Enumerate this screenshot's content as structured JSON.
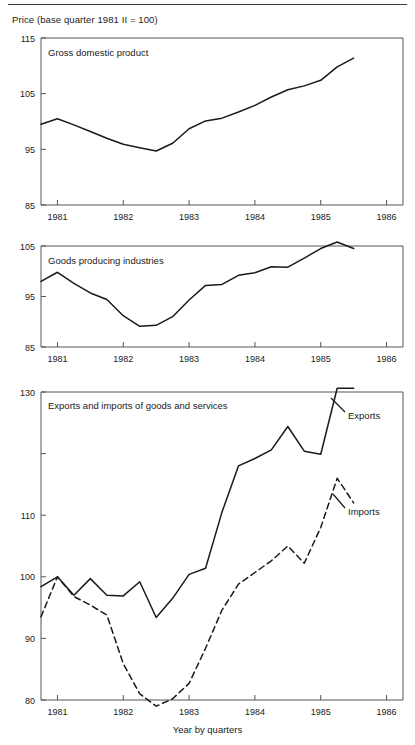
{
  "figure": {
    "super_title": "Price (base quarter 1981 II = 100)",
    "x_axis_title": "Year by quarters",
    "line_color": "#1a1a1a",
    "axis_color": "#555555",
    "background": "#ffffff"
  },
  "chart_data": [
    {
      "type": "line",
      "title": "Gross domestic product",
      "xlabel": "",
      "ylabel": "",
      "ylim": [
        85,
        115
      ],
      "yticks": [
        85,
        95,
        105,
        115
      ],
      "ytick_labels": [
        "85",
        "95",
        "105",
        "115"
      ],
      "xlim": [
        1980.75,
        1986.25
      ],
      "xticks": [
        1981,
        1982,
        1983,
        1984,
        1985,
        1986
      ],
      "xtick_labels": [
        "1981",
        "1982",
        "1983",
        "1984",
        "1985",
        "1986"
      ],
      "grid": false,
      "legend": "none",
      "series": [
        {
          "name": "Gross domestic product",
          "style": "solid",
          "x": [
            1980.75,
            1981.0,
            1981.25,
            1981.5,
            1981.75,
            1982.0,
            1982.25,
            1982.5,
            1982.75,
            1983.0,
            1983.25,
            1983.5,
            1983.75,
            1984.0,
            1984.25,
            1984.5,
            1984.75,
            1985.0,
            1985.25,
            1985.5
          ],
          "values": [
            99.5,
            100.5,
            99.4,
            98.2,
            97.0,
            95.9,
            95.3,
            94.7,
            96.1,
            98.7,
            100.1,
            100.6,
            101.7,
            102.9,
            104.4,
            105.7,
            106.4,
            107.4,
            109.8,
            111.4
          ]
        }
      ]
    },
    {
      "type": "line",
      "title": "Goods producing industries",
      "xlabel": "",
      "ylabel": "",
      "ylim": [
        85,
        105
      ],
      "yticks": [
        85,
        95,
        105
      ],
      "ytick_labels": [
        "85",
        "95",
        "105"
      ],
      "xlim": [
        1980.75,
        1986.25
      ],
      "xticks": [
        1981,
        1982,
        1983,
        1984,
        1985,
        1986
      ],
      "xtick_labels": [
        "1981",
        "1982",
        "1983",
        "1984",
        "1985",
        "1986"
      ],
      "grid": false,
      "legend": "none",
      "series": [
        {
          "name": "Goods producing industries",
          "style": "solid",
          "x": [
            1980.75,
            1981.0,
            1981.25,
            1981.5,
            1981.75,
            1982.0,
            1982.25,
            1982.5,
            1982.75,
            1983.0,
            1983.25,
            1983.5,
            1983.75,
            1984.0,
            1984.25,
            1984.5,
            1984.75,
            1985.0,
            1985.25,
            1985.5
          ],
          "values": [
            98.0,
            99.8,
            97.6,
            95.7,
            94.4,
            91.2,
            89.1,
            89.3,
            91.0,
            94.3,
            97.2,
            97.4,
            99.2,
            99.7,
            100.9,
            100.8,
            102.6,
            104.5,
            105.8,
            104.5
          ]
        }
      ]
    },
    {
      "type": "line",
      "title": "Exports and imports of goods and services",
      "xlabel": "Year by quarters",
      "ylabel": "",
      "ylim": [
        80,
        130
      ],
      "yticks": [
        80,
        90,
        100,
        110,
        120,
        130
      ],
      "ytick_labels": [
        "80",
        "90",
        "100",
        "110",
        "",
        "130"
      ],
      "xlim": [
        1980.75,
        1986.25
      ],
      "xticks": [
        1981,
        1982,
        1983,
        1984,
        1985,
        1986
      ],
      "xtick_labels": [
        "1981",
        "1982",
        "1983",
        "1984",
        "1985",
        "1986"
      ],
      "grid": false,
      "legend": "inline-annotations",
      "series": [
        {
          "name": "Exports",
          "style": "solid",
          "x": [
            1980.75,
            1981.0,
            1981.25,
            1981.5,
            1981.75,
            1982.0,
            1982.25,
            1982.5,
            1982.75,
            1983.0,
            1983.25,
            1983.5,
            1983.75,
            1984.0,
            1984.25,
            1984.5,
            1984.75,
            1985.0,
            1985.25,
            1985.5
          ],
          "values": [
            98.4,
            100.0,
            97.0,
            99.7,
            97.0,
            96.9,
            99.2,
            93.4,
            96.5,
            100.4,
            101.4,
            110.5,
            118.0,
            119.2,
            120.6,
            124.4,
            120.4,
            119.9,
            130.6,
            130.6
          ]
        },
        {
          "name": "Imports",
          "style": "dashed",
          "x": [
            1980.75,
            1981.0,
            1981.25,
            1981.5,
            1981.75,
            1982.0,
            1982.25,
            1982.5,
            1982.75,
            1983.0,
            1983.25,
            1983.5,
            1983.75,
            1984.0,
            1984.25,
            1984.5,
            1984.75,
            1985.0,
            1985.25,
            1985.5
          ],
          "values": [
            93.5,
            100.0,
            96.8,
            95.4,
            93.8,
            85.9,
            81.0,
            79.0,
            80.2,
            82.7,
            88.4,
            94.6,
            98.8,
            100.7,
            102.6,
            105.0,
            102.2,
            108.0,
            116.0,
            112.0
          ]
        }
      ],
      "annotations": [
        {
          "name": "Exports",
          "label": "Exports"
        },
        {
          "name": "Imports",
          "label": "Imports"
        }
      ]
    }
  ]
}
